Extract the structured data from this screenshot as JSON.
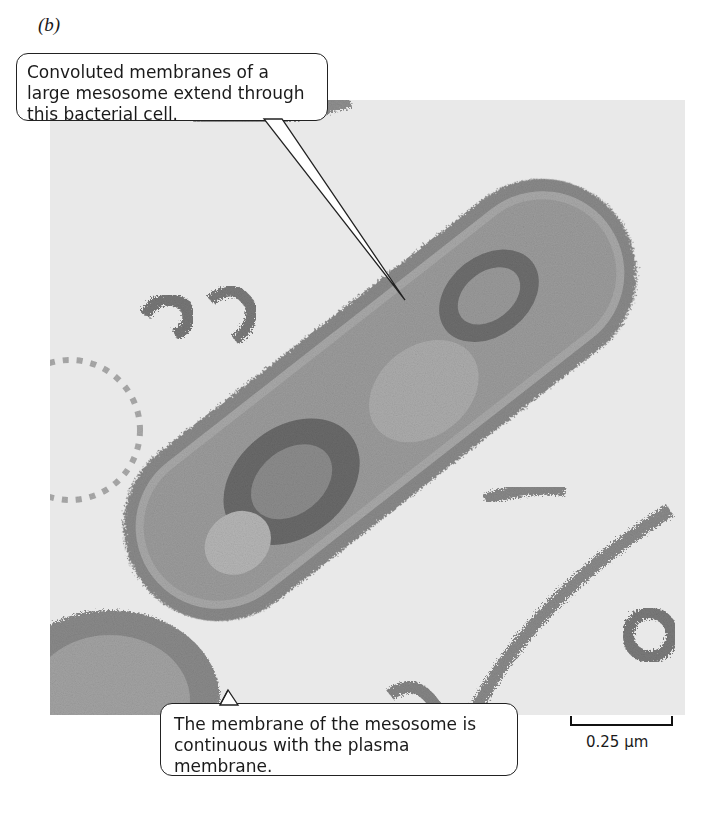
{
  "figure": {
    "panel_label": "(b)",
    "image_description": "Transmission electron micrograph of a rod-shaped bacterial cell containing a large mesosome",
    "callouts": [
      {
        "id": "top",
        "text": "Convoluted membranes of a large mesosome extend through this bacterial cell."
      },
      {
        "id": "bottom",
        "text": "The membrane of the mesosome is continuous with the plasma membrane."
      }
    ],
    "scale_bar": {
      "label": "0.25 µm"
    }
  }
}
